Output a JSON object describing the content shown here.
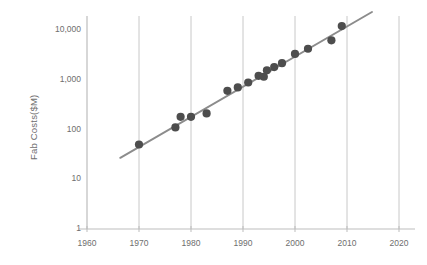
{
  "chart_data": {
    "type": "scatter",
    "title": "",
    "xlabel": "",
    "ylabel": "Fab Costs($M)",
    "xlim": [
      1960,
      2020
    ],
    "ylim": [
      1,
      10000
    ],
    "yscale": "log",
    "xscale": "linear",
    "grid": "vertical-only",
    "legend": "none",
    "xticks": [
      "1960",
      "1970",
      "1980",
      "1990",
      "2000",
      "2010",
      "2020"
    ],
    "xtick_values": [
      1960,
      1970,
      1980,
      1990,
      2000,
      2010,
      2020
    ],
    "yticks": [
      "1",
      "10",
      "100",
      "1,000",
      "10,000"
    ],
    "ytick_values": [
      1,
      10,
      100,
      1000,
      10000
    ],
    "series": [
      {
        "name": "Fab Costs",
        "type": "scatter",
        "marker": "circle",
        "color": "#4d4d4d",
        "points": [
          {
            "x": 1970,
            "y": 50
          },
          {
            "x": 1977,
            "y": 110
          },
          {
            "x": 1978,
            "y": 180
          },
          {
            "x": 1980,
            "y": 180
          },
          {
            "x": 1983,
            "y": 210
          },
          {
            "x": 1987,
            "y": 600
          },
          {
            "x": 1989,
            "y": 700
          },
          {
            "x": 1991,
            "y": 880
          },
          {
            "x": 1993,
            "y": 1200
          },
          {
            "x": 1994,
            "y": 1150
          },
          {
            "x": 1994.6,
            "y": 1550
          },
          {
            "x": 1996,
            "y": 1800
          },
          {
            "x": 1997.5,
            "y": 2150
          },
          {
            "x": 2000,
            "y": 3300
          },
          {
            "x": 2002.5,
            "y": 4200
          },
          {
            "x": 2007,
            "y": 6200
          },
          {
            "x": 2009,
            "y": 12000
          }
        ]
      },
      {
        "name": "Trend Line",
        "type": "line",
        "color": "#8c8c8c",
        "endpoints": [
          {
            "x": 1966.4,
            "y": 27
          },
          {
            "x": 2014.8,
            "y": 23000
          }
        ]
      }
    ]
  },
  "axes": {
    "y_title": "Fab Costs($M)",
    "x_tick_labels": [
      "1960",
      "1970",
      "1980",
      "1990",
      "2000",
      "2010",
      "2020"
    ],
    "y_tick_labels": [
      "10,000",
      "1,000",
      "100",
      "10",
      "1"
    ]
  },
  "colors": {
    "background": "#ffffff",
    "marker": "#4d4d4d",
    "trend_line": "#8c8c8c",
    "gridline": "#c8c8c8",
    "axis_line": "#bdbdbd",
    "tick_text": "#6e6e6e"
  }
}
